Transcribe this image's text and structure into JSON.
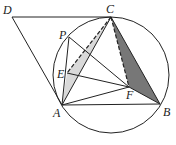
{
  "figure": {
    "type": "geometry",
    "labels": {
      "D": "D",
      "C": "C",
      "P": "P",
      "E": "E",
      "A": "A",
      "F": "F",
      "B": "B"
    },
    "points": {
      "D": [
        12,
        17
      ],
      "C": [
        111,
        17
      ],
      "P": [
        69,
        37
      ],
      "E": [
        67,
        73
      ],
      "A": [
        62,
        105
      ],
      "F": [
        129,
        87
      ],
      "B": [
        160,
        104
      ]
    },
    "circle": {
      "cx": 111,
      "cy": 75,
      "r": 58
    },
    "colors": {
      "stroke": "#222222",
      "light_fill": "#d9d9d9",
      "dark_fill": "#777777"
    }
  }
}
